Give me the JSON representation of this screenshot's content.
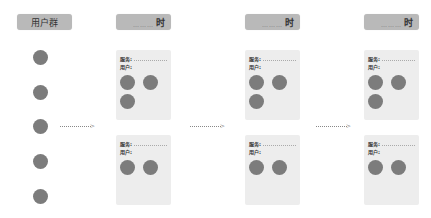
{
  "user_group": {
    "header": "用户群",
    "circles": 5
  },
  "columns": [
    {
      "header_dots": "………",
      "header_suffix": "时",
      "cards": [
        {
          "service_label": "服务:",
          "user_label": "用户:",
          "users": 3
        },
        {
          "service_label": "服务:",
          "user_label": "用户:",
          "users": 2
        }
      ]
    },
    {
      "header_dots": "………",
      "header_suffix": "时",
      "cards": [
        {
          "service_label": "服务:",
          "user_label": "用户:",
          "users": 3
        },
        {
          "service_label": "服务:",
          "user_label": "用户:",
          "users": 2
        }
      ]
    },
    {
      "header_dots": "………",
      "header_suffix": "时",
      "cards": [
        {
          "service_label": "服务:",
          "user_label": "用户:",
          "users": 3
        },
        {
          "service_label": "服务:",
          "user_label": "用户:",
          "users": 2
        }
      ]
    }
  ],
  "arrow_head": ">",
  "colors": {
    "header_bg": "#b9b9b9",
    "card_bg": "#ededed",
    "circle": "#7c7c7c"
  }
}
